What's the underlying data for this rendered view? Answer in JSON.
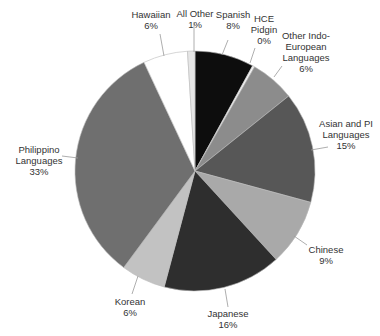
{
  "chart_data": {
    "type": "pie",
    "title": "",
    "start_angle_deg": 0,
    "direction": "clockwise",
    "slices": [
      {
        "label": "Spanish",
        "value": 8,
        "display": "8%",
        "color": "#0d0d0d"
      },
      {
        "label": "HCE Pidgin",
        "value": 0.3,
        "display": "0%",
        "color": "#f2f2f2"
      },
      {
        "label": "Other Indo-European Languages",
        "value": 6,
        "display": "6%",
        "color": "#8c8c8c"
      },
      {
        "label": "Asian and PI Languages",
        "value": 15,
        "display": "15%",
        "color": "#575757"
      },
      {
        "label": "Chinese",
        "value": 9,
        "display": "9%",
        "color": "#a9a9a9"
      },
      {
        "label": "Japanese",
        "value": 16,
        "display": "16%",
        "color": "#2e2e2e"
      },
      {
        "label": "Korean",
        "value": 6,
        "display": "6%",
        "color": "#c2c2c2"
      },
      {
        "label": "Philippino Languages",
        "value": 33,
        "display": "33%",
        "color": "#6f6f6f"
      },
      {
        "label": "Hawaiian",
        "value": 6,
        "display": "6%",
        "color": "#ffffff"
      },
      {
        "label": "All Other",
        "value": 1,
        "display": "1%",
        "color": "#e6e6e6"
      }
    ],
    "legend": "none (direct labels with leader lines)"
  },
  "labels": {
    "spanish": {
      "name": "Spanish",
      "pct": "8%"
    },
    "hce": {
      "name1": "HCE",
      "name2": "Pidgin",
      "pct": "0%"
    },
    "other_ie": {
      "name1": "Other Indo-",
      "name2": "European",
      "name3": "Languages",
      "pct": "6%"
    },
    "asian": {
      "name1": "Asian and PI",
      "name2": "Languages",
      "pct": "15%"
    },
    "chinese": {
      "name": "Chinese",
      "pct": "9%"
    },
    "japanese": {
      "name": "Japanese",
      "pct": "16%"
    },
    "korean": {
      "name": "Korean",
      "pct": "6%"
    },
    "philippino": {
      "name1": "Philippino",
      "name2": "Languages",
      "pct": "33%"
    },
    "hawaiian": {
      "name": "Hawaiian",
      "pct": "6%"
    },
    "all_other": {
      "name": "All Other",
      "pct": "1%"
    }
  }
}
